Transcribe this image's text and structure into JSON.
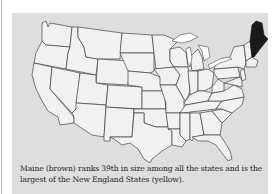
{
  "figure": {
    "type": "us-state-map",
    "highlighted_state": "Maine",
    "colors": {
      "panel_background": "#dedede",
      "state_fill": "#f1f1f1",
      "state_border": "#2a2a2a",
      "highlight_fill": "#1a1a1a",
      "lakes": "#ffffff"
    },
    "caption": "Maine (brown) ranks 39th in size among all the states and is the largest of the New England States (yellow)."
  }
}
